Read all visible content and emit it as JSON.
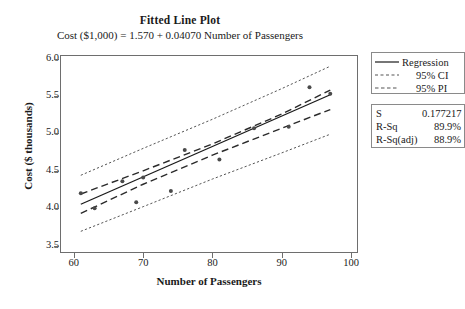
{
  "chart_data": {
    "type": "scatter",
    "title": "Fitted Line Plot",
    "subtitle": "Cost ($1,000) = 1.570 + 0.04070 Number of Passengers",
    "xlabel": "Number of Passengers",
    "ylabel": "Cost ($ thousands)",
    "xlim": [
      58,
      101
    ],
    "ylim": [
      3.4,
      6.05
    ],
    "xticks": [
      "60",
      "70",
      "80",
      "90",
      "100"
    ],
    "xtick_values": [
      60,
      70,
      80,
      90,
      100
    ],
    "yticks": [
      "3.5",
      "4.0",
      "4.5",
      "5.0",
      "5.5",
      "6.0"
    ],
    "ytick_values": [
      3.5,
      4.0,
      4.5,
      5.0,
      5.5,
      6.0
    ],
    "grid": false,
    "legend_position": "right",
    "regression": {
      "intercept": 1.57,
      "slope": 0.0407,
      "equation": "Cost ($1,000) = 1.570 + 0.04070 Number of Passengers"
    },
    "points": [
      {
        "x": 61,
        "y": 4.2
      },
      {
        "x": 63,
        "y": 4.0
      },
      {
        "x": 67,
        "y": 4.36
      },
      {
        "x": 69,
        "y": 4.08
      },
      {
        "x": 70,
        "y": 4.41
      },
      {
        "x": 74,
        "y": 4.23
      },
      {
        "x": 76,
        "y": 4.78
      },
      {
        "x": 81,
        "y": 4.65
      },
      {
        "x": 86,
        "y": 5.07
      },
      {
        "x": 91,
        "y": 5.09
      },
      {
        "x": 94,
        "y": 5.62
      },
      {
        "x": 97,
        "y": 5.53
      }
    ],
    "bands": {
      "ci_upper": [
        {
          "x": 61,
          "y": 4.19
        },
        {
          "x": 70,
          "y": 4.5
        },
        {
          "x": 80,
          "y": 4.86
        },
        {
          "x": 90,
          "y": 5.26
        },
        {
          "x": 97,
          "y": 5.58
        }
      ],
      "ci_lower": [
        {
          "x": 61,
          "y": 3.93
        },
        {
          "x": 70,
          "y": 4.32
        },
        {
          "x": 80,
          "y": 4.71
        },
        {
          "x": 90,
          "y": 5.07
        },
        {
          "x": 97,
          "y": 5.32
        }
      ],
      "pi_upper": [
        {
          "x": 61,
          "y": 4.44
        },
        {
          "x": 70,
          "y": 4.8
        },
        {
          "x": 80,
          "y": 5.19
        },
        {
          "x": 90,
          "y": 5.6
        },
        {
          "x": 97,
          "y": 5.9
        }
      ],
      "pi_lower": [
        {
          "x": 61,
          "y": 3.69
        },
        {
          "x": 70,
          "y": 4.02
        },
        {
          "x": 80,
          "y": 4.39
        },
        {
          "x": 90,
          "y": 4.74
        },
        {
          "x": 97,
          "y": 4.99
        }
      ]
    },
    "series_styles": {
      "regression": "solid",
      "ci": "dashed",
      "pi": "dotted"
    }
  },
  "legend": {
    "items": [
      {
        "label": "Regression",
        "style": "solid"
      },
      {
        "label": "95% CI",
        "style": "dashed"
      },
      {
        "label": "95% PI",
        "style": "dotted"
      }
    ]
  },
  "stats": {
    "rows": [
      {
        "key": "S",
        "value": "0.177217"
      },
      {
        "key": "R-Sq",
        "value": "89.9%"
      },
      {
        "key": "R-Sq(adj)",
        "value": "88.9%"
      }
    ]
  },
  "colors": {
    "line": "#1a1a1a",
    "point": "#4a4a4a",
    "frame": "#6e6e6e",
    "background": "#ffffff"
  }
}
